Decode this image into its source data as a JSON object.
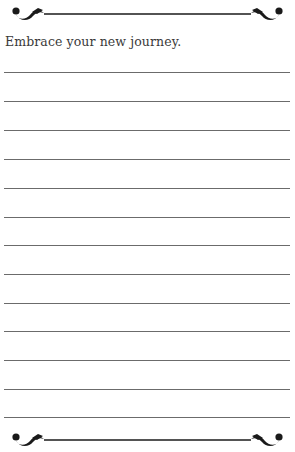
{
  "page": {
    "prompt": "Embrace your new journey.",
    "line_count": 13,
    "line_positions": [
      72,
      101,
      130,
      159,
      188,
      217,
      245,
      274,
      303,
      331,
      360,
      389,
      417
    ],
    "colors": {
      "ink": "#1a1a1a",
      "rule": "#6b6b6b",
      "text": "#3a3a3a",
      "background": "#ffffff"
    }
  },
  "decorations": {
    "top": "flourish-divider-icon",
    "bottom": "flourish-divider-icon"
  }
}
